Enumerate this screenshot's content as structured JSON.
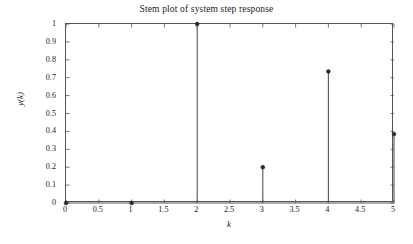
{
  "chart_data": {
    "type": "stem",
    "title": "Stem plot of system step response",
    "xlabel": "k",
    "ylabel": "y(k)",
    "x": [
      0,
      1,
      2,
      3,
      4,
      5
    ],
    "values": [
      0,
      0,
      1,
      0.2,
      0.735,
      0.385
    ],
    "xlim": [
      0,
      5
    ],
    "ylim": [
      0,
      1
    ],
    "xticks": [
      0,
      0.5,
      1,
      1.5,
      2,
      2.5,
      3,
      3.5,
      4,
      4.5,
      5
    ],
    "xtick_labels": [
      "0",
      "0.5",
      "1",
      "1.5",
      "2",
      "2.5",
      "3",
      "3.5",
      "4",
      "4.5",
      "5"
    ],
    "yticks": [
      0,
      0.1,
      0.2,
      0.3,
      0.4,
      0.5,
      0.6,
      0.7,
      0.8,
      0.9,
      1
    ],
    "ytick_labels": [
      "0",
      "0.1",
      "0.2",
      "0.3",
      "0.4",
      "0.5",
      "0.6",
      "0.7",
      "0.8",
      "0.9",
      "1"
    ],
    "grid": false,
    "legend": null,
    "line_color": "#555555",
    "marker_color": "#2b2b2b",
    "axis_color": "#555555",
    "background": "#ffffff"
  }
}
